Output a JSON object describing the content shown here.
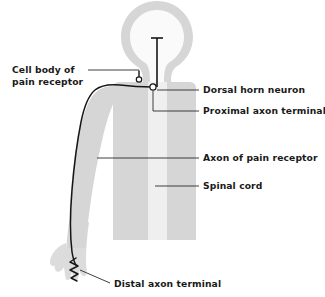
{
  "figure": {
    "type": "anatomical-diagram"
  },
  "colors": {
    "body_fill": "#d6d6d6",
    "body_fill_light": "#e2e2e2",
    "spinal_cord_fill": "#efefef",
    "head_interior_fill": "#fafafa",
    "neuron_stroke": "#161616",
    "leader_stroke": "#2a2a2a",
    "label_text": "#1a1a1a",
    "background": "#ffffff"
  },
  "labels": {
    "cell_body": {
      "line1": "Cell body of",
      "line2": "pain receptor"
    },
    "dorsal_horn_neuron": "Dorsal horn neuron",
    "proximal_axon_terminal": "Proximal axon terminal",
    "axon_of_pain_receptor": "Axon of pain receptor",
    "spinal_cord": "Spinal cord",
    "distal_axon_terminal": "Distal axon terminal"
  },
  "structures": {
    "head": "head",
    "torso": "torso",
    "arm": "arm",
    "hand": "hand",
    "spinal_cord_strip": "spinal-cord-strip",
    "soma_cell_body": "cell-body-circle",
    "soma_dorsal_horn": "dorsal-horn-circle",
    "ascending_tract": "ascending-tract-line",
    "axon_path": "axon-path",
    "distal_terminal_squiggle": "distal-terminal-squiggle"
  }
}
